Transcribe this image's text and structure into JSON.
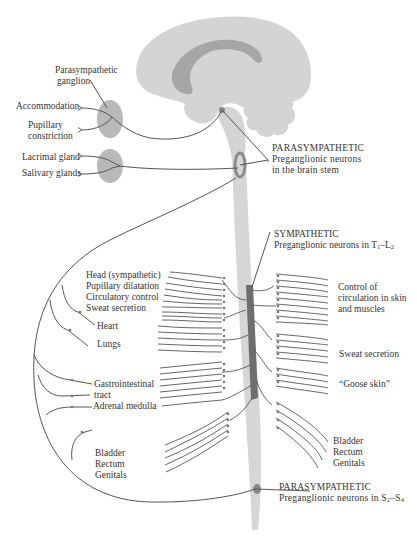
{
  "colors": {
    "brain_fill": "#d4d4d4",
    "corpus_callosum": "#a6a6a6",
    "spinal_cord": "#d6d6d6",
    "sympathetic_chain": "#6e6e6e",
    "ganglion": "#b9b9b9",
    "nerve_line": "#555555",
    "text": "#333333"
  },
  "labels": {
    "para_ganglion": [
      "Parasympathetic",
      "ganglion"
    ],
    "accommodation": "Accommodation",
    "pupillary_constriction": [
      "Pupillary",
      "constriction"
    ],
    "lacrimal": "Lacrimal gland",
    "salivary": "Salivary glands",
    "para_brainstem": {
      "heading": "PARASYMPATHETIC",
      "line1": "Preganglionic neurons",
      "line2": "in the brain stem"
    },
    "sympathetic": {
      "heading": "SYMPATHETIC",
      "line1": "Preganglionic neurons in T",
      "sub1": "1",
      "dash": "–L",
      "sub2": "2"
    },
    "head_sym": [
      "Head (sympathetic)",
      "Pupillary dilatation",
      "Circulatory control",
      "Sweat secretion"
    ],
    "heart": "Heart",
    "lungs": "Lungs",
    "gi": [
      "Gastrointestinal",
      "tract"
    ],
    "adrenal": "Adrenal medulla",
    "pelvic_left": [
      "Bladder",
      "Rectum",
      "Genitals"
    ],
    "circulation": [
      "Control of",
      "circulation in skin",
      "and muscles"
    ],
    "sweat": "Sweat secretion",
    "goose": "“Goose skin”",
    "pelvic_right": [
      "Bladder",
      "Rectum",
      "Genitals"
    ],
    "para_sacral": {
      "heading": "PARASYMPATHETIC",
      "line1": "Preganglionic neurons in S",
      "sub1": "2",
      "dash": "–S",
      "sub2": "4"
    }
  }
}
